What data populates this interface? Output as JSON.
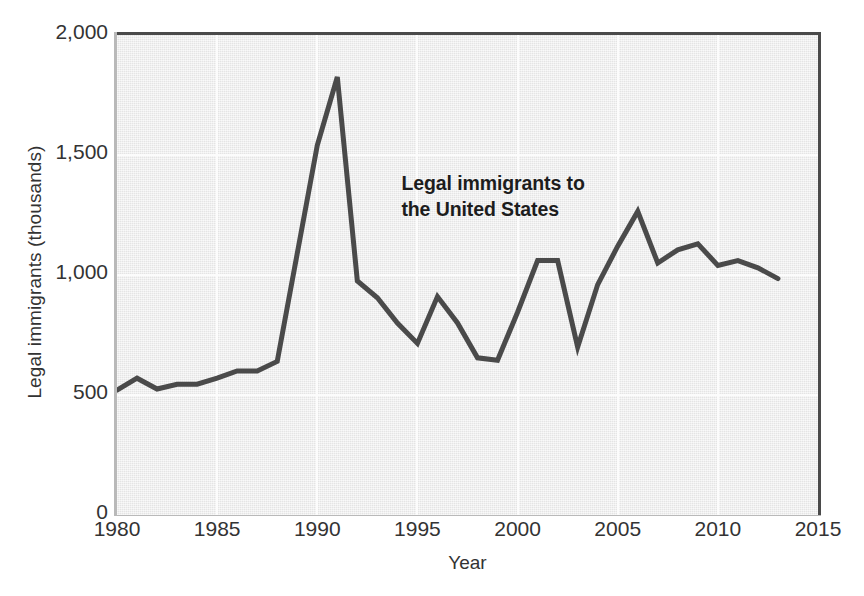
{
  "chart_data": {
    "type": "line",
    "title": "",
    "subtitle": "",
    "xlabel": "Year",
    "ylabel": "Legal immigrants (thousands)",
    "xlim": [
      1980,
      2015
    ],
    "ylim": [
      0,
      2000
    ],
    "xticks": [
      1980,
      1985,
      1990,
      1995,
      2000,
      2005,
      2010,
      2015
    ],
    "xtick_labels": [
      "1980",
      "1985",
      "1990",
      "1995",
      "2000",
      "2005",
      "2010",
      "2015"
    ],
    "yticks": [
      0,
      500,
      1000,
      1500,
      2000
    ],
    "ytick_labels": [
      "0",
      "500",
      "1,000",
      "1,500",
      "2,000"
    ],
    "grid": true,
    "grid_color": "#fcfcfc",
    "plot_background": "#ededed",
    "line_color": "#4a4a4a",
    "line_width": 5,
    "legend": "none",
    "annotations": [
      {
        "text": "Legal immigrants to\nthe United States",
        "x": 1994.2,
        "y": 1420,
        "bold": true
      }
    ],
    "series": [
      {
        "name": "Legal immigrants to the United States",
        "x": [
          1980,
          1981,
          1982,
          1983,
          1984,
          1985,
          1986,
          1987,
          1988,
          1989,
          1990,
          1991,
          1992,
          1993,
          1994,
          1995,
          1996,
          1997,
          1998,
          1999,
          2000,
          2001,
          2002,
          2003,
          2004,
          2005,
          2006,
          2007,
          2008,
          2009,
          2010,
          2011,
          2012,
          2013
        ],
        "values": [
          520,
          570,
          525,
          545,
          545,
          570,
          600,
          600,
          640,
          1090,
          1540,
          1825,
          975,
          905,
          800,
          715,
          910,
          800,
          655,
          645,
          845,
          1060,
          1060,
          700,
          960,
          1120,
          1265,
          1050,
          1105,
          1130,
          1040,
          1060,
          1030,
          985
        ]
      }
    ]
  },
  "axes": {
    "y_title": "Legal immigrants (thousands)",
    "x_title": "Year"
  }
}
